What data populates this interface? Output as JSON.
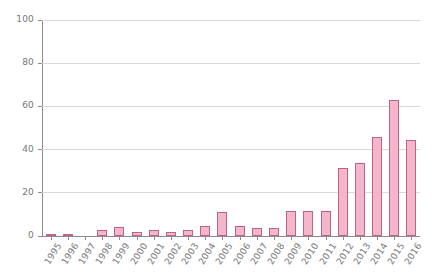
{
  "chart_data": {
    "type": "bar",
    "title": "",
    "subtitle": "",
    "xlabel": "",
    "ylabel": "",
    "ylim": [
      0,
      100
    ],
    "yticks": [
      0,
      20,
      40,
      60,
      80,
      100
    ],
    "grid": true,
    "legend": "none",
    "bar_fill_color": "#f4b6cb",
    "bar_border_color": "#bf6283",
    "gridline_color": "#d9d9d9",
    "axis_color": "#8c8c8c",
    "tick_label_color": "#767676",
    "categories": [
      "1995",
      "1996",
      "1997",
      "1998",
      "1999",
      "2000",
      "2001",
      "2002",
      "2003",
      "2004",
      "2005",
      "2006",
      "2007",
      "2008",
      "2009",
      "2010",
      "2011",
      "2012",
      "2013",
      "2014",
      "2015",
      "2016"
    ],
    "values": [
      1,
      1,
      0,
      3,
      4,
      2,
      3,
      2,
      3,
      4.5,
      11,
      4.5,
      3.5,
      3.5,
      11.5,
      11.5,
      11.5,
      31.5,
      34,
      46,
      63,
      44.5
    ]
  }
}
